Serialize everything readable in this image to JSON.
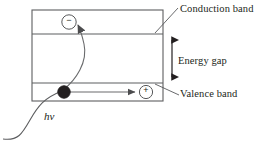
{
  "figure": {
    "type": "semiconductor-band-diagram",
    "title_text": "",
    "line_color": "#58595b",
    "text_color": "#231f20",
    "carrier_fill": "#231f20",
    "background": "#ffffff"
  },
  "labels": {
    "conduction_band": "Conduction band",
    "valence_band": "Valence band",
    "energy_gap": "Energy gap",
    "photon": "hv"
  },
  "carriers": {
    "electron": {
      "name": "electron",
      "sign": "−",
      "marker": "circle-open",
      "x": 69,
      "y": 22
    },
    "hole": {
      "name": "hole",
      "sign": "+",
      "marker": "circle-open",
      "x": 146,
      "y": 92
    },
    "excited_source": {
      "name": "excited-electron-dot",
      "marker": "circle-filled",
      "x": 64,
      "y": 92
    }
  },
  "bands": {
    "conduction_band_region": {
      "top": 10,
      "bottom": 34
    },
    "energy_gap_region": {
      "top": 34,
      "bottom": 83
    },
    "valence_band_region": {
      "top": 83,
      "bottom": 101
    },
    "box_left": 32,
    "box_right": 163
  },
  "annotations": {
    "energy_gap_arrow": {
      "x": 172,
      "y_top": 33,
      "y_bottom": 84,
      "double_headed": true
    },
    "conduction_leader": {
      "x1": 155,
      "y1": 33,
      "x2": 178,
      "y2": 8
    },
    "valence_leader": {
      "x1": 155,
      "y1": 84,
      "x2": 179,
      "y2": 95
    },
    "electron_transition_arrow": {
      "from_x": 64,
      "from_y": 90,
      "to_x": 78,
      "to_y": 22
    },
    "hole_drift_arrow": {
      "from_x": 70,
      "from_y": 92,
      "to_x": 139,
      "to_y": 92
    },
    "photon_curve": {
      "start_x": 3,
      "start_y": 139,
      "end_x": 62,
      "end_y": 91
    }
  }
}
